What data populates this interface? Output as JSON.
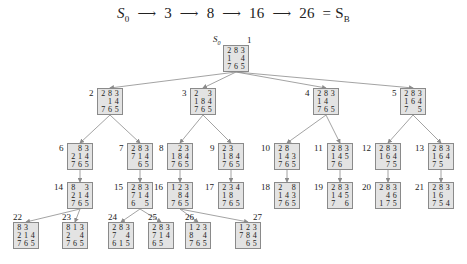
{
  "solution_path": {
    "start_label": "S",
    "start_sub": "0",
    "steps": [
      "3",
      "8",
      "16",
      "26"
    ],
    "goal_label": "= S",
    "goal_sub": "B"
  },
  "root_label": {
    "name": "S",
    "sub": "0"
  },
  "nodes": [
    {
      "id": 1,
      "label": "1",
      "x": 223,
      "y": 45,
      "grid": [
        "2",
        "8",
        "3",
        "1",
        "",
        "4",
        "7",
        "6",
        "5"
      ]
    },
    {
      "id": 2,
      "label": "2",
      "x": 97,
      "y": 88,
      "grid": [
        "2",
        "8",
        "3",
        "",
        "1",
        "4",
        "7",
        "6",
        "5"
      ]
    },
    {
      "id": 3,
      "label": "3",
      "x": 190,
      "y": 88,
      "grid": [
        "2",
        "",
        "3",
        "1",
        "8",
        "4",
        "7",
        "6",
        "5"
      ]
    },
    {
      "id": 4,
      "label": "4",
      "x": 313,
      "y": 88,
      "grid": [
        "2",
        "8",
        "3",
        "1",
        "4",
        "",
        "7",
        "6",
        "5"
      ]
    },
    {
      "id": 5,
      "label": "5",
      "x": 400,
      "y": 88,
      "grid": [
        "2",
        "8",
        "3",
        "1",
        "6",
        "4",
        "7",
        "",
        "5"
      ]
    },
    {
      "id": 6,
      "label": "6",
      "x": 67,
      "y": 143,
      "grid": [
        "",
        "8",
        "3",
        "2",
        "1",
        "4",
        "7",
        "6",
        "5"
      ]
    },
    {
      "id": 7,
      "label": "7",
      "x": 127,
      "y": 143,
      "grid": [
        "2",
        "8",
        "3",
        "7",
        "1",
        "4",
        "",
        "6",
        "5"
      ]
    },
    {
      "id": 8,
      "label": "8",
      "x": 167,
      "y": 143,
      "grid": [
        "",
        "2",
        "3",
        "1",
        "8",
        "4",
        "7",
        "6",
        "5"
      ]
    },
    {
      "id": 9,
      "label": "9",
      "x": 218,
      "y": 143,
      "grid": [
        "2",
        "3",
        "",
        "1",
        "8",
        "4",
        "7",
        "6",
        "5"
      ]
    },
    {
      "id": 10,
      "label": "10",
      "x": 274,
      "y": 143,
      "grid": [
        "2",
        "8",
        "",
        "1",
        "4",
        "3",
        "7",
        "6",
        "5"
      ]
    },
    {
      "id": 11,
      "label": "11",
      "x": 327,
      "y": 143,
      "grid": [
        "2",
        "8",
        "3",
        "1",
        "4",
        "5",
        "7",
        "6",
        ""
      ]
    },
    {
      "id": 12,
      "label": "12",
      "x": 375,
      "y": 143,
      "grid": [
        "2",
        "8",
        "3",
        "1",
        "6",
        "4",
        "",
        "7",
        "5"
      ]
    },
    {
      "id": 13,
      "label": "13",
      "x": 428,
      "y": 143,
      "grid": [
        "2",
        "8",
        "3",
        "1",
        "6",
        "4",
        "7",
        "5",
        ""
      ]
    },
    {
      "id": 14,
      "label": "14",
      "x": 67,
      "y": 182,
      "grid": [
        "8",
        "",
        "3",
        "2",
        "1",
        "4",
        "7",
        "6",
        "5"
      ]
    },
    {
      "id": 15,
      "label": "15",
      "x": 127,
      "y": 182,
      "grid": [
        "2",
        "8",
        "3",
        "7",
        "1",
        "4",
        "6",
        "",
        "5"
      ]
    },
    {
      "id": 16,
      "label": "16",
      "x": 167,
      "y": 182,
      "grid": [
        "1",
        "2",
        "3",
        "",
        "8",
        "4",
        "7",
        "6",
        "5"
      ]
    },
    {
      "id": 17,
      "label": "17",
      "x": 218,
      "y": 182,
      "grid": [
        "2",
        "3",
        "4",
        "1",
        "8",
        "",
        "7",
        "6",
        "5"
      ]
    },
    {
      "id": 18,
      "label": "18",
      "x": 274,
      "y": 182,
      "grid": [
        "2",
        "",
        "8",
        "1",
        "4",
        "3",
        "7",
        "6",
        "5"
      ]
    },
    {
      "id": 19,
      "label": "19",
      "x": 327,
      "y": 182,
      "grid": [
        "2",
        "8",
        "3",
        "1",
        "4",
        "5",
        "7",
        "",
        "6"
      ]
    },
    {
      "id": 20,
      "label": "20",
      "x": 375,
      "y": 182,
      "grid": [
        "2",
        "8",
        "3",
        "",
        "4",
        "6",
        "1",
        "7",
        "5"
      ]
    },
    {
      "id": 21,
      "label": "21",
      "x": 428,
      "y": 182,
      "grid": [
        "2",
        "8",
        "3",
        "1",
        "6",
        "",
        "7",
        "5",
        "4"
      ]
    },
    {
      "id": 22,
      "label": "22",
      "x": 13,
      "y": 222,
      "grid": [
        "8",
        "3",
        "",
        "2",
        "1",
        "4",
        "7",
        "6",
        "5"
      ]
    },
    {
      "id": 23,
      "label": "23",
      "x": 62,
      "y": 222,
      "grid": [
        "8",
        "1",
        "3",
        "2",
        "",
        "4",
        "7",
        "6",
        "5"
      ]
    },
    {
      "id": 24,
      "label": "24",
      "x": 108,
      "y": 222,
      "grid": [
        "2",
        "8",
        "3",
        "7",
        "",
        "4",
        "6",
        "1",
        "5"
      ]
    },
    {
      "id": 25,
      "label": "25",
      "x": 148,
      "y": 222,
      "grid": [
        "2",
        "8",
        "3",
        "7",
        "1",
        "4",
        "6",
        "5",
        ""
      ]
    },
    {
      "id": 26,
      "label": "26",
      "x": 185,
      "y": 222,
      "grid": [
        "1",
        "2",
        "3",
        "8",
        "",
        "4",
        "7",
        "6",
        "5"
      ]
    },
    {
      "id": 27,
      "label": "27",
      "x": 235,
      "y": 222,
      "grid": [
        "1",
        "2",
        "3",
        "7",
        "8",
        "4",
        "",
        "6",
        "5"
      ]
    }
  ],
  "edges": [
    [
      1,
      2
    ],
    [
      1,
      3
    ],
    [
      1,
      4
    ],
    [
      1,
      5
    ],
    [
      2,
      6
    ],
    [
      2,
      7
    ],
    [
      3,
      8
    ],
    [
      3,
      9
    ],
    [
      4,
      10
    ],
    [
      4,
      11
    ],
    [
      5,
      12
    ],
    [
      5,
      13
    ],
    [
      6,
      14
    ],
    [
      7,
      15
    ],
    [
      8,
      16
    ],
    [
      9,
      17
    ],
    [
      10,
      18
    ],
    [
      11,
      19
    ],
    [
      12,
      20
    ],
    [
      13,
      21
    ],
    [
      14,
      22
    ],
    [
      14,
      23
    ],
    [
      15,
      24
    ],
    [
      15,
      25
    ],
    [
      16,
      26
    ],
    [
      16,
      27
    ]
  ],
  "colors": {
    "node_fill": "#e3e3e3",
    "node_border": "#8a8a8a",
    "edge": "#8c8c8c",
    "text": "#222222"
  }
}
